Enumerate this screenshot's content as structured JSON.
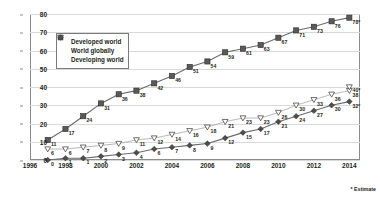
{
  "footnote": "* Estimate",
  "legend": {
    "position": "inside-top-left",
    "items": [
      {
        "label": "Developed world",
        "marker": "filled-square-icon",
        "color": "#595959"
      },
      {
        "label": "World globally",
        "marker": "open-triangle-icon",
        "color": "#404040"
      },
      {
        "label": "Developing world",
        "marker": "filled-diamond-icon",
        "color": "#4d4d4d"
      }
    ]
  },
  "chart_data": {
    "type": "line",
    "title": "",
    "xlabel": "",
    "ylabel": "",
    "grid": true,
    "xlim": [
      1996,
      2014.6
    ],
    "ylim": [
      0,
      80
    ],
    "yticks": [
      0,
      10,
      20,
      30,
      40,
      50,
      60,
      70,
      80
    ],
    "xticks": [
      1996,
      1998,
      2000,
      2002,
      2004,
      2006,
      2008,
      2010,
      2012,
      2014
    ],
    "x": [
      1997,
      1998,
      1999,
      2000,
      2001,
      2002,
      2003,
      2004,
      2005,
      2006,
      2007,
      2008,
      2009,
      2010,
      2011,
      2012,
      2013,
      2014
    ],
    "series": [
      {
        "name": "Developed world",
        "marker": "square",
        "values": [
          11,
          17,
          24,
          31,
          36,
          38,
          42,
          46,
          51,
          54,
          59,
          61,
          63,
          67,
          71,
          73,
          76,
          78
        ],
        "labels": [
          "11",
          "17",
          "24",
          "31",
          "36",
          "38",
          "42",
          "46",
          "51",
          "54",
          "59",
          "61",
          "63",
          "67",
          "71",
          "73",
          "76",
          "78*"
        ]
      },
      {
        "name": "World globally",
        "marker": "triangle",
        "values": [
          6,
          6,
          7,
          8,
          9,
          11,
          12,
          14,
          16,
          18,
          21,
          23,
          23,
          26,
          30,
          33,
          36,
          38
        ],
        "labels": [
          "6",
          "6",
          "7",
          "8",
          "9",
          "11",
          "12",
          "14",
          "16",
          "18",
          "21",
          "23",
          "23",
          "26",
          "30",
          "33",
          "36",
          "38"
        ],
        "extra_point": {
          "x": 2014,
          "value": 40,
          "label": "40*"
        }
      },
      {
        "name": "Developing world",
        "marker": "diamond",
        "values": [
          0,
          1,
          1,
          2,
          3,
          4,
          6,
          7,
          8,
          9,
          12,
          15,
          17,
          21,
          24,
          27,
          30,
          32
        ],
        "labels": [
          "0",
          "1",
          "1",
          "2",
          "3",
          "4",
          "6",
          "7",
          "8",
          "9",
          "12",
          "15",
          "17",
          "21",
          "24",
          "27",
          "30",
          "32*"
        ]
      }
    ]
  }
}
